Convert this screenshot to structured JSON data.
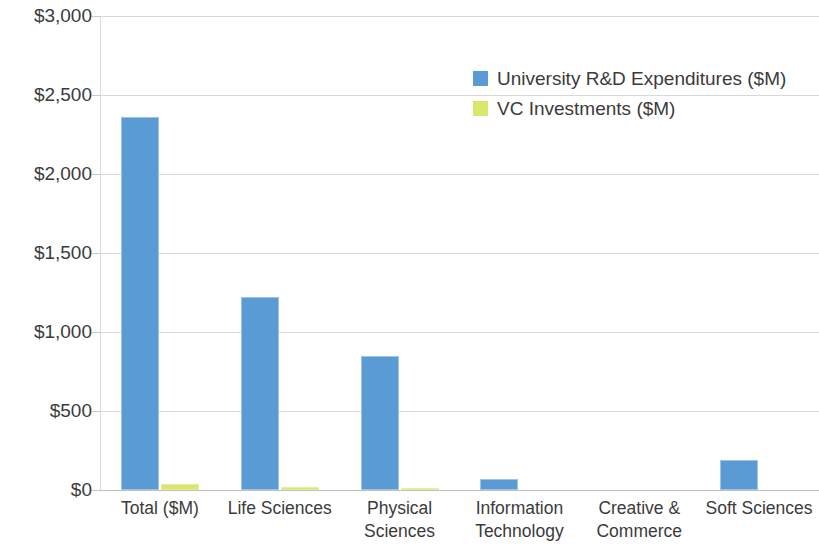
{
  "chart_data": {
    "type": "bar",
    "title": "",
    "subtitle": "",
    "xlabel": "",
    "ylabel": "",
    "ylim": [
      0,
      3000
    ],
    "ytick_values": [
      0,
      500,
      1000,
      1500,
      2000,
      2500,
      3000
    ],
    "ytick_labels": [
      "$0",
      "$500",
      "$1,000",
      "$1,500",
      "$2,000",
      "$2,500",
      "$3,000"
    ],
    "grid": true,
    "legend_position": "upper right inside",
    "categories": [
      "Total ($M)",
      "Life Sciences",
      "Physical Sciences",
      "Information Technology",
      "Creative & Commerce",
      "Soft Sciences"
    ],
    "category_lines": [
      [
        "Total ($M)"
      ],
      [
        "Life Sciences"
      ],
      [
        "Physical",
        "Sciences"
      ],
      [
        "Information",
        "Technology"
      ],
      [
        "Creative &",
        "Commerce"
      ],
      [
        "Soft Sciences"
      ]
    ],
    "series": [
      {
        "name": "University R&D Expenditures ($M)",
        "color": "#5B9BD5",
        "values": [
          2360,
          1220,
          850,
          70,
          0,
          190
        ]
      },
      {
        "name": "VC Investments ($M)",
        "color": "#DBE76A",
        "values": [
          40,
          22,
          10,
          0,
          0,
          0
        ]
      }
    ]
  },
  "legend": {
    "entries": [
      {
        "label": "University R&D Expenditures ($M)",
        "swatch": "legend-swatch-blue"
      },
      {
        "label": "VC Investments ($M)",
        "swatch": "legend-swatch-green"
      }
    ]
  },
  "colors": {
    "series_blue": "#5B9BD5",
    "series_green": "#DBE76A",
    "gridline": "#D9D9D9",
    "text": "#3B3B3B",
    "background": "#FFFFFF"
  }
}
